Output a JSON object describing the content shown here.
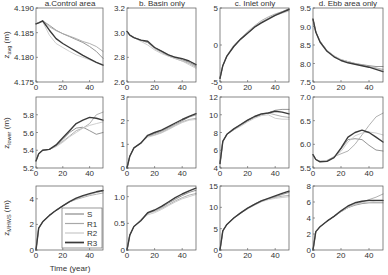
{
  "chart_data": {
    "type": "line",
    "layout": "grid-3x4",
    "xlabel": "Time (year)",
    "xlim": [
      0,
      50
    ],
    "xticks": [
      0,
      20,
      40
    ],
    "series_names": [
      "S",
      "R1",
      "R2",
      "R3"
    ],
    "series_colors": [
      "#8a8a8a",
      "#a8a8a8",
      "#c8c8c8",
      "#3a3a3a"
    ],
    "legend": {
      "panel": "row3-col1",
      "placement": "bottom-right",
      "entries": [
        "S",
        "R1",
        "R2",
        "R3"
      ]
    },
    "column_titles": [
      "a.Control area",
      "b. Basin only",
      "c. Inlet only",
      "d. Ebb area only"
    ],
    "row_ylabels": [
      "z_avg (m)",
      "z_lower (m)",
      "z_MHWS (m)"
    ],
    "x": [
      0,
      2,
      5,
      10,
      15,
      20,
      25,
      30,
      35,
      40,
      45,
      50
    ],
    "panels": [
      {
        "id": "row1-col1",
        "row": 0,
        "col": 0,
        "ylim": [
          4.175,
          4.19
        ],
        "yticks": [
          "4.175",
          "4.180",
          "4.185",
          "4.190"
        ],
        "series": [
          {
            "name": "S",
            "values": [
              4.1868,
              4.187,
              4.1874,
              4.1865,
              4.1855,
              4.1848,
              4.1842,
              4.1836,
              4.183,
              4.1822,
              4.1812,
              4.1798
            ]
          },
          {
            "name": "R1",
            "values": [
              4.1868,
              4.187,
              4.1874,
              4.1862,
              4.1854,
              4.1848,
              4.1843,
              4.1838,
              4.1832,
              4.1828,
              4.1822,
              4.1812
            ]
          },
          {
            "name": "R2",
            "values": [
              4.1868,
              4.187,
              4.1872,
              4.1845,
              4.1828,
              4.182,
              4.1812,
              4.1805,
              4.18,
              4.1795,
              4.179,
              4.1785
            ]
          },
          {
            "name": "R3",
            "values": [
              4.1868,
              4.187,
              4.1874,
              4.1855,
              4.1838,
              4.1828,
              4.182,
              4.1812,
              4.1804,
              4.1797,
              4.179,
              4.1784
            ]
          }
        ]
      },
      {
        "id": "row1-col2",
        "row": 0,
        "col": 1,
        "ylim": [
          2.6,
          3.2
        ],
        "yticks": [
          "2.6",
          "2.8",
          "3.0",
          "3.2"
        ],
        "series": [
          {
            "name": "S",
            "values": [
              3.01,
              2.98,
              2.96,
              2.94,
              2.92,
              2.88,
              2.85,
              2.82,
              2.8,
              2.78,
              2.76,
              2.73
            ]
          },
          {
            "name": "R1",
            "values": [
              3.01,
              2.98,
              2.96,
              2.94,
              2.92,
              2.87,
              2.84,
              2.81,
              2.79,
              2.77,
              2.75,
              2.72
            ]
          },
          {
            "name": "R2",
            "values": [
              3.01,
              2.98,
              2.96,
              2.93,
              2.9,
              2.86,
              2.83,
              2.81,
              2.79,
              2.77,
              2.74,
              2.71
            ]
          },
          {
            "name": "R3",
            "values": [
              3.01,
              2.98,
              2.96,
              2.94,
              2.93,
              2.88,
              2.85,
              2.82,
              2.8,
              2.79,
              2.77,
              2.74
            ]
          }
        ]
      },
      {
        "id": "row1-col3",
        "row": 0,
        "col": 2,
        "ylim": [
          -5,
          5
        ],
        "yticks": [
          "-5",
          "0",
          "5"
        ],
        "series": [
          {
            "name": "S",
            "values": [
              -4.5,
              -2.8,
              -1.5,
              -0.2,
              0.8,
              1.6,
              2.4,
              3.1,
              3.6,
              4.1,
              4.5,
              4.9
            ]
          },
          {
            "name": "R1",
            "values": [
              -4.5,
              -2.8,
              -1.5,
              -0.1,
              0.9,
              1.8,
              2.6,
              3.3,
              3.8,
              4.2,
              4.5,
              4.8
            ]
          },
          {
            "name": "R2",
            "values": [
              -4.5,
              -2.8,
              -1.4,
              0.0,
              0.9,
              1.7,
              2.5,
              3.2,
              3.6,
              4.0,
              4.3,
              4.6
            ]
          },
          {
            "name": "R3",
            "values": [
              -4.5,
              -2.8,
              -1.5,
              -0.2,
              0.8,
              1.6,
              2.4,
              3.0,
              3.5,
              4.0,
              4.4,
              4.8
            ]
          }
        ]
      },
      {
        "id": "row1-col4",
        "row": 0,
        "col": 3,
        "ylim": [
          7.5,
          9.5
        ],
        "yticks": [
          "7.5",
          "8.0",
          "8.5",
          "9.0",
          "9.5"
        ],
        "series": [
          {
            "name": "S",
            "values": [
              9.2,
              8.85,
              8.6,
              8.35,
              8.2,
              8.1,
              8.05,
              8.0,
              7.97,
              7.94,
              7.92,
              7.92
            ]
          },
          {
            "name": "R1",
            "values": [
              9.2,
              8.85,
              8.6,
              8.35,
              8.2,
              8.1,
              8.05,
              8.0,
              7.96,
              7.92,
              7.88,
              7.84
            ]
          },
          {
            "name": "R2",
            "values": [
              9.2,
              8.85,
              8.6,
              8.36,
              8.21,
              8.11,
              8.05,
              8.0,
              7.95,
              7.91,
              7.87,
              7.82
            ]
          },
          {
            "name": "R3",
            "values": [
              9.2,
              8.85,
              8.58,
              8.33,
              8.18,
              8.08,
              8.02,
              7.98,
              7.94,
              7.9,
              7.84,
              7.78
            ]
          }
        ]
      },
      {
        "id": "row2-col1",
        "row": 1,
        "col": 0,
        "ylim": [
          5.2,
          6.0
        ],
        "yticks": [
          "5.2",
          "5.4",
          "5.6",
          "5.8"
        ],
        "series": [
          {
            "name": "S",
            "values": [
              5.28,
              5.36,
              5.4,
              5.41,
              5.45,
              5.52,
              5.6,
              5.65,
              5.66,
              5.62,
              5.58,
              5.6
            ]
          },
          {
            "name": "R1",
            "values": [
              5.28,
              5.36,
              5.4,
              5.41,
              5.45,
              5.5,
              5.56,
              5.62,
              5.65,
              5.7,
              5.8,
              5.83
            ]
          },
          {
            "name": "R2",
            "values": [
              5.28,
              5.36,
              5.4,
              5.41,
              5.44,
              5.49,
              5.55,
              5.6,
              5.65,
              5.68,
              5.7,
              5.72
            ]
          },
          {
            "name": "R3",
            "values": [
              5.28,
              5.36,
              5.4,
              5.41,
              5.46,
              5.54,
              5.62,
              5.7,
              5.74,
              5.77,
              5.76,
              5.74
            ]
          }
        ]
      },
      {
        "id": "row2-col2",
        "row": 1,
        "col": 1,
        "ylim": [
          0,
          3
        ],
        "yticks": [
          "0",
          "1",
          "2",
          "3"
        ],
        "series": [
          {
            "name": "S",
            "values": [
              0.0,
              0.5,
              0.85,
              1.05,
              1.35,
              1.45,
              1.55,
              1.7,
              1.85,
              2.0,
              2.15,
              2.25
            ]
          },
          {
            "name": "R1",
            "values": [
              0.0,
              0.5,
              0.85,
              1.05,
              1.35,
              1.4,
              1.5,
              1.65,
              1.8,
              1.95,
              2.05,
              2.1
            ]
          },
          {
            "name": "R2",
            "values": [
              0.0,
              0.5,
              0.85,
              1.08,
              1.3,
              1.38,
              1.48,
              1.62,
              1.78,
              1.92,
              2.02,
              2.05
            ]
          },
          {
            "name": "R3",
            "values": [
              0.0,
              0.5,
              0.85,
              1.05,
              1.38,
              1.5,
              1.6,
              1.75,
              1.9,
              2.05,
              2.18,
              2.3
            ]
          }
        ]
      },
      {
        "id": "row2-col3",
        "row": 1,
        "col": 2,
        "ylim": [
          4,
          12
        ],
        "yticks": [
          "4",
          "6",
          "8",
          "10",
          "12"
        ],
        "series": [
          {
            "name": "S",
            "values": [
              4.5,
              7.0,
              7.8,
              8.3,
              8.8,
              9.3,
              9.7,
              10.0,
              10.2,
              10.5,
              10.6,
              10.6
            ]
          },
          {
            "name": "R1",
            "values": [
              4.5,
              7.0,
              7.8,
              8.4,
              8.9,
              9.4,
              9.8,
              10.1,
              10.2,
              10.0,
              9.8,
              9.7
            ]
          },
          {
            "name": "R2",
            "values": [
              4.5,
              7.0,
              7.8,
              8.3,
              8.7,
              9.2,
              9.6,
              9.9,
              10.0,
              9.6,
              9.5,
              9.5
            ]
          },
          {
            "name": "R3",
            "values": [
              4.5,
              7.0,
              7.8,
              8.4,
              8.9,
              9.4,
              9.8,
              10.1,
              10.2,
              10.4,
              10.3,
              10.1
            ]
          }
        ]
      },
      {
        "id": "row2-col4",
        "row": 1,
        "col": 3,
        "ylim": [
          5.5,
          7.0
        ],
        "yticks": [
          "5.5",
          "6.0",
          "6.5",
          "7.0"
        ],
        "series": [
          {
            "name": "S",
            "values": [
              5.78,
              5.68,
              5.64,
              5.65,
              5.72,
              5.9,
              6.1,
              6.12,
              6.1,
              5.98,
              5.88,
              5.86
            ]
          },
          {
            "name": "R1",
            "values": [
              5.78,
              5.68,
              5.64,
              5.66,
              5.74,
              5.8,
              5.86,
              6.0,
              6.2,
              6.4,
              6.58,
              6.66
            ]
          },
          {
            "name": "R2",
            "values": [
              5.78,
              5.68,
              5.64,
              5.65,
              5.73,
              5.85,
              6.05,
              6.18,
              6.24,
              6.26,
              6.24,
              6.2
            ]
          },
          {
            "name": "R3",
            "values": [
              5.78,
              5.68,
              5.63,
              5.64,
              5.72,
              5.92,
              6.15,
              6.25,
              6.3,
              6.25,
              6.15,
              6.05
            ]
          }
        ]
      },
      {
        "id": "row3-col1",
        "row": 2,
        "col": 0,
        "ylim": [
          0,
          5
        ],
        "yticks": [
          "0",
          "2",
          "4"
        ],
        "series": [
          {
            "name": "S",
            "values": [
              0.0,
              1.7,
              2.2,
              2.7,
              3.1,
              3.45,
              3.75,
              4.0,
              4.2,
              4.35,
              4.5,
              4.6
            ]
          },
          {
            "name": "R1",
            "values": [
              0.0,
              1.7,
              2.2,
              2.7,
              3.1,
              3.45,
              3.75,
              3.95,
              4.1,
              4.25,
              4.35,
              4.45
            ]
          },
          {
            "name": "R2",
            "values": [
              0.0,
              1.7,
              2.2,
              2.7,
              3.1,
              3.45,
              3.75,
              4.0,
              4.2,
              4.35,
              4.5,
              4.62
            ]
          },
          {
            "name": "R3",
            "values": [
              0.0,
              1.7,
              2.2,
              2.7,
              3.1,
              3.45,
              3.78,
              4.05,
              4.25,
              4.4,
              4.55,
              4.65
            ]
          }
        ]
      },
      {
        "id": "row3-col2",
        "row": 2,
        "col": 1,
        "ylim": [
          0,
          1.2
        ],
        "yticks": [
          "0",
          "0.5",
          "1.0"
        ],
        "series": [
          {
            "name": "S",
            "values": [
              0.0,
              0.28,
              0.44,
              0.55,
              0.68,
              0.74,
              0.8,
              0.88,
              0.95,
              1.02,
              1.08,
              1.12
            ]
          },
          {
            "name": "R1",
            "values": [
              0.0,
              0.28,
              0.44,
              0.56,
              0.7,
              0.72,
              0.78,
              0.85,
              0.92,
              0.98,
              1.03,
              1.06
            ]
          },
          {
            "name": "R2",
            "values": [
              0.0,
              0.28,
              0.44,
              0.57,
              0.66,
              0.7,
              0.76,
              0.83,
              0.9,
              0.96,
              1.0,
              1.04
            ]
          },
          {
            "name": "R3",
            "values": [
              0.0,
              0.28,
              0.44,
              0.55,
              0.7,
              0.75,
              0.82,
              0.9,
              0.98,
              1.05,
              1.11,
              1.16
            ]
          }
        ]
      },
      {
        "id": "row3-col3",
        "row": 2,
        "col": 2,
        "ylim": [
          0,
          15
        ],
        "yticks": [
          "0",
          "5",
          "10",
          "15"
        ],
        "series": [
          {
            "name": "S",
            "values": [
              0.0,
              4.5,
              6.0,
              7.5,
              8.7,
              9.7,
              10.6,
              11.4,
              12.0,
              12.5,
              13.0,
              13.5
            ]
          },
          {
            "name": "R1",
            "values": [
              0.0,
              4.5,
              6.0,
              7.6,
              8.8,
              9.8,
              10.8,
              11.6,
              12.0,
              12.3,
              12.6,
              12.8
            ]
          },
          {
            "name": "R2",
            "values": [
              0.0,
              4.5,
              6.0,
              7.4,
              8.6,
              9.6,
              10.5,
              11.3,
              11.8,
              12.1,
              12.3,
              12.5
            ]
          },
          {
            "name": "R3",
            "values": [
              0.0,
              4.5,
              6.0,
              7.5,
              8.7,
              9.8,
              10.7,
              11.5,
              12.1,
              12.7,
              13.3,
              13.8
            ]
          }
        ]
      },
      {
        "id": "row3-col4",
        "row": 2,
        "col": 3,
        "ylim": [
          0,
          8
        ],
        "yticks": [
          "0",
          "2",
          "4",
          "6",
          "8"
        ],
        "series": [
          {
            "name": "S",
            "values": [
              0.0,
              2.3,
              2.9,
              3.6,
              4.2,
              4.8,
              5.3,
              5.6,
              5.8,
              5.9,
              5.9,
              5.9
            ]
          },
          {
            "name": "R1",
            "values": [
              0.0,
              2.3,
              2.9,
              3.6,
              4.2,
              4.8,
              5.3,
              5.7,
              6.0,
              6.3,
              6.6,
              7.0
            ]
          },
          {
            "name": "R2",
            "values": [
              0.0,
              2.3,
              2.9,
              3.6,
              4.2,
              4.8,
              5.3,
              5.7,
              5.9,
              6.0,
              6.1,
              6.1
            ]
          },
          {
            "name": "R3",
            "values": [
              0.0,
              2.3,
              2.9,
              3.6,
              4.2,
              4.9,
              5.5,
              5.9,
              6.1,
              6.2,
              6.2,
              6.2
            ]
          }
        ]
      }
    ]
  }
}
